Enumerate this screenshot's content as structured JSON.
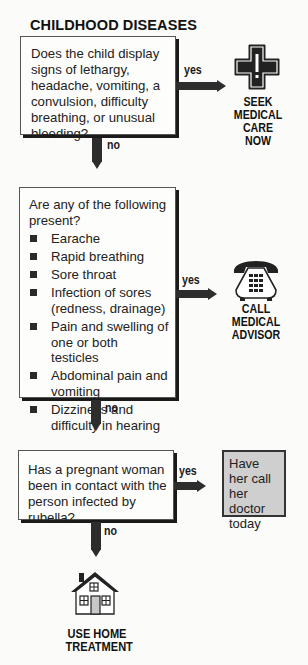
{
  "title": "CHILDHOOD DISEASES",
  "nodes": {
    "q1": {
      "text": "Does the child display signs of lethargy, headache, vomiting, a convulsion, difficulty breathing, or unusual bleeding?"
    },
    "q2": {
      "intro": "Are any of the following present?",
      "items": [
        "Earache",
        "Rapid breathing",
        "Sore throat",
        "Infection of sores (redness, drainage)",
        "Pain and swelling of one or both testicles",
        "Abdominal pain and vomiting",
        "Dizziness and difficulty in hearing"
      ]
    },
    "q3": {
      "text": "Has a pregnant woman been in contact with the person infected by rubella?"
    }
  },
  "edges": {
    "yes": "yes",
    "no": "no"
  },
  "outcomes": {
    "seek_care": {
      "icon": "medical-cross-icon",
      "line1": "SEEK",
      "line2": "MEDICAL",
      "line3": "CARE NOW"
    },
    "call_advisor": {
      "icon": "telephone-icon",
      "line1": "CALL",
      "line2": "MEDICAL",
      "line3": "ADVISOR"
    },
    "call_doctor": {
      "text": "Have her call her doctor today"
    },
    "home": {
      "icon": "house-icon",
      "line1": "USE HOME",
      "line2": "TREATMENT"
    }
  },
  "colors": {
    "ink": "#2d2d2d",
    "graybox": "#cfcfcf",
    "paper": "#fbfbf9"
  }
}
